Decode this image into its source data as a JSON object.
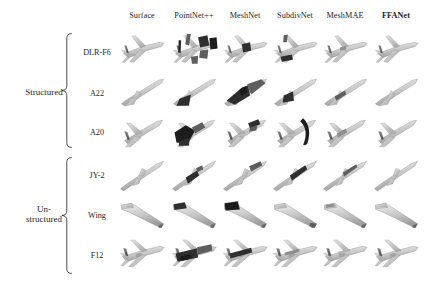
{
  "figure": {
    "type": "qualitative-comparison-grid",
    "background_color": "#ffffff",
    "ink_color": "#1d1d1d"
  },
  "columns": [
    {
      "id": "surface",
      "label": "Surface",
      "bold": false,
      "x": 142
    },
    {
      "id": "pointnet2",
      "label": "PointNet++",
      "bold": false,
      "x": 194
    },
    {
      "id": "meshnet",
      "label": "MeshNet",
      "bold": false,
      "x": 245
    },
    {
      "id": "subdivnet",
      "label": "SubdivNet",
      "bold": false,
      "x": 295
    },
    {
      "id": "meshmae",
      "label": "MeshMAE",
      "bold": false,
      "x": 345
    },
    {
      "id": "ffanet",
      "label": "FFANet",
      "bold": true,
      "x": 396
    }
  ],
  "groups": [
    {
      "id": "structured",
      "label": "Structured",
      "label_lines": [
        "Structured"
      ],
      "label_x": 44,
      "label_y": 92,
      "brace_x": 72,
      "brace_top": 33,
      "brace_bottom": 148,
      "rows": [
        "dlr_f6",
        "a22",
        "a20"
      ]
    },
    {
      "id": "unstructured",
      "label": "Un-structured",
      "label_lines": [
        "Un-",
        "structured"
      ],
      "label_x": 44,
      "label_y": 214,
      "brace_x": 72,
      "brace_top": 157,
      "brace_bottom": 274,
      "rows": [
        "jy2",
        "wing",
        "f12"
      ]
    }
  ],
  "rows": [
    {
      "id": "dlr_f6",
      "label": "DLR-F6",
      "group": "structured",
      "label_x": 97,
      "y": 52,
      "shape": "airliner_swept"
    },
    {
      "id": "a22",
      "label": "A22",
      "group": "structured",
      "label_x": 97,
      "y": 93,
      "shape": "slender_missile"
    },
    {
      "id": "a20",
      "label": "A20",
      "group": "structured",
      "label_x": 97,
      "y": 132,
      "shape": "delta_fighter"
    },
    {
      "id": "jy2",
      "label": "JY-2",
      "group": "unstructured",
      "label_x": 97,
      "y": 175,
      "shape": "slender_dart"
    },
    {
      "id": "wing",
      "label": "Wing",
      "group": "unstructured",
      "label_x": 97,
      "y": 215,
      "shape": "swept_wing"
    },
    {
      "id": "f12",
      "label": "F12",
      "group": "unstructured",
      "label_x": 97,
      "y": 255,
      "shape": "transport_jet"
    }
  ],
  "grid": {
    "cell_width": 52,
    "cell_height": 40,
    "col_x": [
      116,
      168,
      219,
      269,
      319,
      370
    ],
    "row_y": [
      30,
      72,
      112,
      155,
      194,
      235
    ]
  },
  "cells": [
    {
      "row": "dlr_f6",
      "col": "surface",
      "quality": "clean",
      "artifacts": "none"
    },
    {
      "row": "dlr_f6",
      "col": "pointnet2",
      "quality": "fragmented",
      "artifacts": "large dark detached blocks, broken fuselage"
    },
    {
      "row": "dlr_f6",
      "col": "meshnet",
      "quality": "partial",
      "artifacts": "dark wing-root patch"
    },
    {
      "row": "dlr_f6",
      "col": "subdivnet",
      "quality": "partial",
      "artifacts": "dark tail hook and belly patch"
    },
    {
      "row": "dlr_f6",
      "col": "meshmae",
      "quality": "good",
      "artifacts": "slight shading noise"
    },
    {
      "row": "dlr_f6",
      "col": "ffanet",
      "quality": "clean",
      "artifacts": "none"
    },
    {
      "row": "a22",
      "col": "surface",
      "quality": "clean",
      "artifacts": "none"
    },
    {
      "row": "a22",
      "col": "pointnet2",
      "quality": "partial",
      "artifacts": "dark under-body wedge"
    },
    {
      "row": "a22",
      "col": "meshnet",
      "quality": "fragmented",
      "artifacts": "heavy dark faceted distortion"
    },
    {
      "row": "a22",
      "col": "subdivnet",
      "quality": "partial",
      "artifacts": "dark mid-body blob"
    },
    {
      "row": "a22",
      "col": "meshmae",
      "quality": "good",
      "artifacts": "thin dark streak"
    },
    {
      "row": "a22",
      "col": "ffanet",
      "quality": "clean",
      "artifacts": "none"
    },
    {
      "row": "a20",
      "col": "surface",
      "quality": "clean",
      "artifacts": "none"
    },
    {
      "row": "a20",
      "col": "pointnet2",
      "quality": "fragmented",
      "artifacts": "dark swirl covering nose and wing"
    },
    {
      "row": "a20",
      "col": "meshnet",
      "quality": "partial",
      "artifacts": "dark tail fins"
    },
    {
      "row": "a20",
      "col": "subdivnet",
      "quality": "fragmented",
      "artifacts": "detached dark crescent beside body"
    },
    {
      "row": "a20",
      "col": "meshmae",
      "quality": "good",
      "artifacts": "light shading noise"
    },
    {
      "row": "a20",
      "col": "ffanet",
      "quality": "clean",
      "artifacts": "none"
    },
    {
      "row": "jy2",
      "col": "surface",
      "quality": "clean",
      "artifacts": "none"
    },
    {
      "row": "jy2",
      "col": "pointnet2",
      "quality": "partial",
      "artifacts": "dark speckled mid-section"
    },
    {
      "row": "jy2",
      "col": "meshnet",
      "quality": "partial",
      "artifacts": "dark nose band"
    },
    {
      "row": "jy2",
      "col": "subdivnet",
      "quality": "partial",
      "artifacts": "dark leading edge"
    },
    {
      "row": "jy2",
      "col": "meshmae",
      "quality": "good",
      "artifacts": "dark tip streak"
    },
    {
      "row": "jy2",
      "col": "ffanet",
      "quality": "clean",
      "artifacts": "none"
    },
    {
      "row": "wing",
      "col": "surface",
      "quality": "clean",
      "artifacts": "none"
    },
    {
      "row": "wing",
      "col": "pointnet2",
      "quality": "partial",
      "artifacts": "dark root patch"
    },
    {
      "row": "wing",
      "col": "meshnet",
      "quality": "partial",
      "artifacts": "large dark root block"
    },
    {
      "row": "wing",
      "col": "subdivnet",
      "quality": "good",
      "artifacts": "small dark tip mark"
    },
    {
      "row": "wing",
      "col": "meshmae",
      "quality": "good",
      "artifacts": "faint shading"
    },
    {
      "row": "wing",
      "col": "ffanet",
      "quality": "clean",
      "artifacts": "slight root band"
    },
    {
      "row": "f12",
      "col": "surface",
      "quality": "clean",
      "artifacts": "none"
    },
    {
      "row": "f12",
      "col": "pointnet2",
      "quality": "fragmented",
      "artifacts": "dark mottled fuselage"
    },
    {
      "row": "f12",
      "col": "meshnet",
      "quality": "partial",
      "artifacts": "dark upper fuselage band"
    },
    {
      "row": "f12",
      "col": "subdivnet",
      "quality": "good",
      "artifacts": "light grey body"
    },
    {
      "row": "f12",
      "col": "meshmae",
      "quality": "good",
      "artifacts": "faint shading"
    },
    {
      "row": "f12",
      "col": "ffanet",
      "quality": "clean",
      "artifacts": "none"
    }
  ]
}
